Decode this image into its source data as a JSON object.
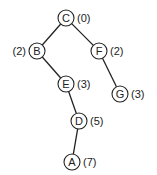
{
  "diagram": {
    "type": "tree",
    "nodes": [
      {
        "id": "C",
        "label": "C",
        "value": "(0)",
        "x": 66,
        "y": 18,
        "value_side": "right"
      },
      {
        "id": "B",
        "label": "B",
        "value": "(2)",
        "x": 37,
        "y": 51,
        "value_side": "left"
      },
      {
        "id": "F",
        "label": "F",
        "value": "(2)",
        "x": 99,
        "y": 51,
        "value_side": "right"
      },
      {
        "id": "E",
        "label": "E",
        "value": "(3)",
        "x": 66,
        "y": 84,
        "value_side": "right"
      },
      {
        "id": "G",
        "label": "G",
        "value": "(3)",
        "x": 120,
        "y": 94,
        "value_side": "right"
      },
      {
        "id": "D",
        "label": "D",
        "value": "(5)",
        "x": 79,
        "y": 121,
        "value_side": "right"
      },
      {
        "id": "A",
        "label": "A",
        "value": "(7)",
        "x": 72,
        "y": 162,
        "value_side": "right"
      }
    ],
    "edges": [
      {
        "from": "C",
        "to": "B"
      },
      {
        "from": "C",
        "to": "F"
      },
      {
        "from": "B",
        "to": "E"
      },
      {
        "from": "F",
        "to": "G"
      },
      {
        "from": "E",
        "to": "D"
      },
      {
        "from": "D",
        "to": "A"
      }
    ],
    "node_radius": 8,
    "colors": {
      "stroke": "#222222",
      "fill": "#ffffff",
      "text": "#222222"
    }
  }
}
